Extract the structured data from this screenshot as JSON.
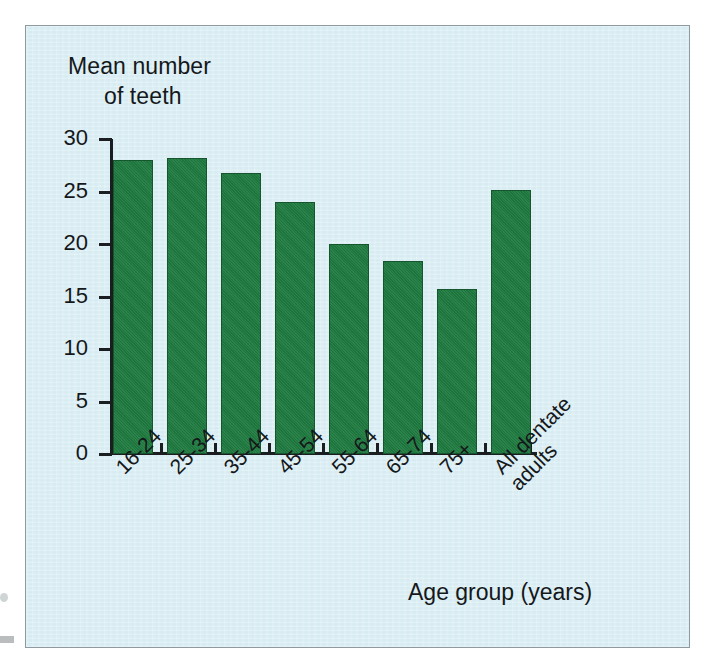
{
  "figure": {
    "background_color": "#d7ecf2",
    "frame_color": "#8e9a9d",
    "bar_color": "#1f7a40",
    "text_color": "#15181b"
  },
  "chart_data": {
    "type": "bar",
    "title": "",
    "ylabel_line1": "Mean number",
    "ylabel_line2": "of teeth",
    "xlabel": "Age group (years)",
    "categories": [
      "16-24",
      "25-34",
      "35-44",
      "45-54",
      "55-64",
      "65-74",
      "75+",
      "All dentate\nadults"
    ],
    "values": [
      28.0,
      28.2,
      26.8,
      24.0,
      20.0,
      18.4,
      15.7,
      25.1
    ],
    "ylim": [
      0,
      30
    ],
    "yticks": [
      "0",
      "5",
      "10",
      "15",
      "20",
      "25",
      "30"
    ],
    "ytick_values": [
      0,
      5,
      10,
      15,
      20,
      25,
      30
    ],
    "grid": false,
    "legend": "none"
  }
}
